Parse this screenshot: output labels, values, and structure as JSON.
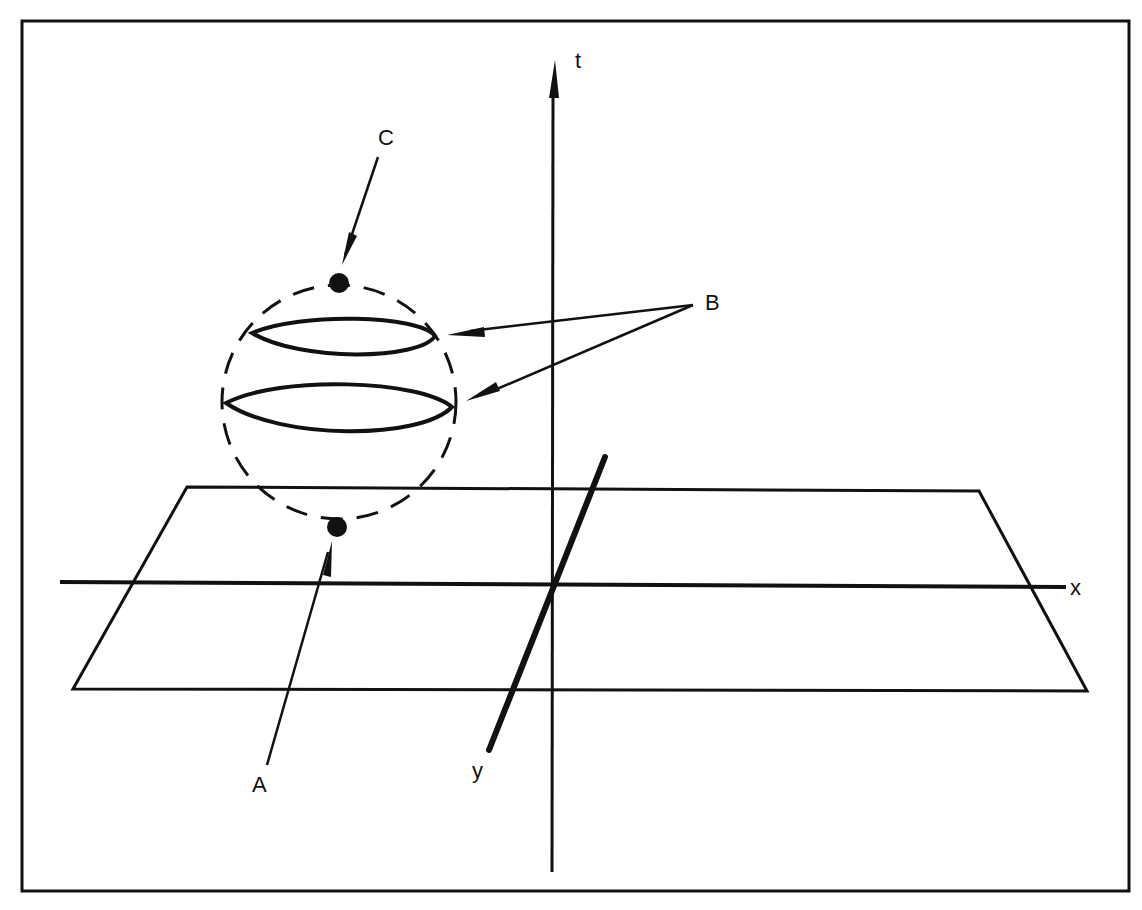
{
  "diagram": {
    "type": "spacetime-diagram",
    "axes": [
      {
        "name": "t",
        "label": "t",
        "direction": "vertical",
        "arrow": true
      },
      {
        "name": "x",
        "label": "x",
        "direction": "horizontal",
        "arrow": false
      },
      {
        "name": "y",
        "label": "y",
        "direction": "oblique",
        "arrow": false
      }
    ],
    "labels": {
      "A": "A",
      "B": "B",
      "C": "C"
    },
    "annotations": [
      {
        "label": "A",
        "points_to": "bottom point of sphere"
      },
      {
        "label": "B",
        "points_to": "two horizontal slice loops of sphere"
      },
      {
        "label": "C",
        "points_to": "top point of sphere"
      }
    ],
    "elements": [
      "frame",
      "spatial-plane",
      "dashed-sphere-outline",
      "slice-loop-upper",
      "slice-loop-lower",
      "point-top",
      "point-bottom"
    ],
    "colors": {
      "ink": "#111111",
      "background": "#ffffff"
    }
  }
}
